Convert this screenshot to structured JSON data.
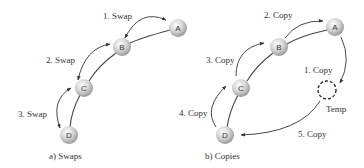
{
  "diagrams": [
    {
      "caption": "a) Swaps",
      "nodes": [
        {
          "id": "A",
          "label": "A"
        },
        {
          "id": "B",
          "label": "B"
        },
        {
          "id": "C",
          "label": "C"
        },
        {
          "id": "D",
          "label": "D"
        }
      ],
      "steps": [
        {
          "label": "1. Swap",
          "between": [
            "A",
            "B"
          ],
          "type": "bidirectional"
        },
        {
          "label": "2. Swap",
          "between": [
            "B",
            "C"
          ],
          "type": "bidirectional"
        },
        {
          "label": "3. Swap",
          "between": [
            "C",
            "D"
          ],
          "type": "bidirectional"
        }
      ]
    },
    {
      "caption": "b) Copies",
      "nodes": [
        {
          "id": "A",
          "label": "A"
        },
        {
          "id": "B",
          "label": "B"
        },
        {
          "id": "C",
          "label": "C"
        },
        {
          "id": "D",
          "label": "D"
        },
        {
          "id": "Temp",
          "label": "Temp",
          "style": "dashed"
        }
      ],
      "steps": [
        {
          "label": "1. Copy",
          "from": "A",
          "to": "Temp"
        },
        {
          "label": "2. Copy",
          "from": "B",
          "to": "A"
        },
        {
          "label": "3. Copy",
          "from": "C",
          "to": "B"
        },
        {
          "label": "4. Copy",
          "from": "D",
          "to": "C"
        },
        {
          "label": "5. Copy",
          "from": "Temp",
          "to": "D"
        }
      ]
    }
  ]
}
